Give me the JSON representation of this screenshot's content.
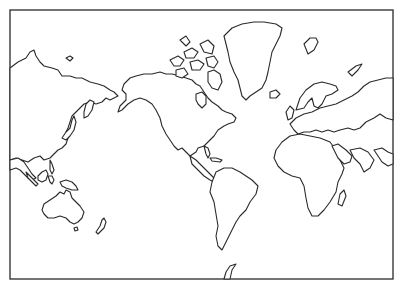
{
  "map": {
    "type": "world outline map",
    "projection": "Mercator-style, Americas centered",
    "labels": [],
    "colors": {
      "stroke": "#2a2a2a",
      "land": "#ffffff",
      "background": "#ffffff"
    },
    "frame": {
      "x": 10,
      "y": 10,
      "width": 383,
      "height": 269
    },
    "regions": [
      "asia-east",
      "alaska",
      "canadian-arctic-islands",
      "greenland",
      "iceland",
      "svalbard",
      "north-america",
      "central-america",
      "caribbean",
      "south-america",
      "europe",
      "scandinavia",
      "british-isles",
      "africa",
      "madagascar",
      "arabian-peninsula",
      "southeast-asia",
      "indonesia",
      "new-guinea",
      "australia",
      "tasmania",
      "new-zealand",
      "japan",
      "antarctic-peninsula",
      "novaya-zemlya"
    ]
  }
}
